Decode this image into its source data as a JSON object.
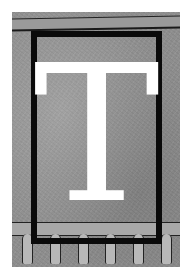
{
  "illustration": {
    "type": "decorative-drop-cap",
    "letter": "T",
    "colors": {
      "background": "#8e8e8e",
      "frame": "#0a0a0a",
      "letter": "#ffffff"
    },
    "baluster_count": 6
  }
}
